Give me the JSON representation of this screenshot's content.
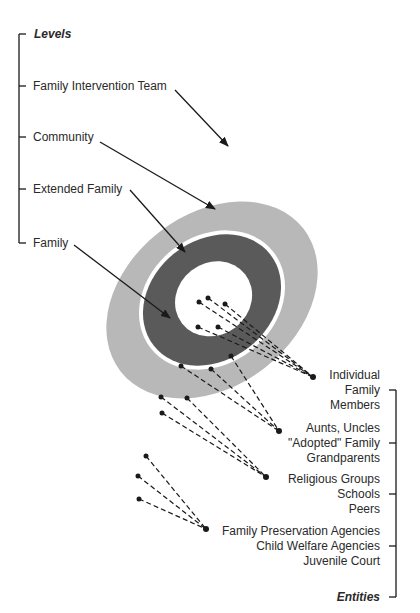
{
  "levels": {
    "heading": "Levels",
    "items": [
      {
        "label": "Family Intervention Team"
      },
      {
        "label": "Community"
      },
      {
        "label": "Extended Family"
      },
      {
        "label": "Family"
      }
    ]
  },
  "entities": {
    "heading": "Entities",
    "groups": [
      {
        "lines": [
          "Individual",
          "Family",
          "Members"
        ]
      },
      {
        "lines": [
          "Aunts, Uncles",
          "\"Adopted\" Family",
          "Grandparents"
        ]
      },
      {
        "lines": [
          "Religious Groups",
          "Schools",
          "Peers"
        ]
      },
      {
        "lines": [
          "Family Preservation Agencies",
          "Child Welfare Agencies",
          "Juvenile Court"
        ]
      }
    ]
  },
  "colors": {
    "community_ring": "#b8b8b8",
    "extended_family_ring": "#5a5a5a",
    "family_core": "#ffffff",
    "lines": "#1a1a1a"
  }
}
